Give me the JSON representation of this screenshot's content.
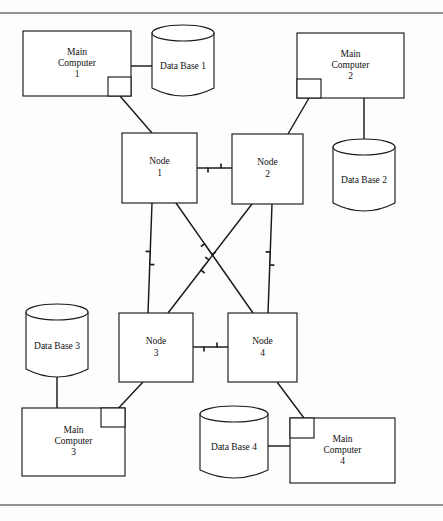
{
  "figure": {
    "rules": {
      "top_y": 13,
      "bottom_y": 505
    }
  },
  "main_computers": [
    {
      "id": "main-computer-1",
      "line1": "Main",
      "line2": "Computer",
      "line3": "1",
      "x": 23,
      "y": 31,
      "w": 108,
      "h": 65,
      "notch": {
        "corner": "bottom-right",
        "x": 108,
        "y": 77,
        "w": 23,
        "h": 19
      }
    },
    {
      "id": "main-computer-2",
      "line1": "Main",
      "line2": "Computer",
      "line3": "2",
      "x": 297,
      "y": 33,
      "w": 107,
      "h": 65,
      "notch": {
        "corner": "bottom-left",
        "x": 297,
        "y": 79,
        "w": 24,
        "h": 19
      }
    },
    {
      "id": "main-computer-3",
      "line1": "Main",
      "line2": "Computer",
      "line3": "3",
      "x": 22,
      "y": 408,
      "w": 103,
      "h": 68,
      "notch": {
        "corner": "top-right",
        "x": 101,
        "y": 408,
        "w": 24,
        "h": 19
      }
    },
    {
      "id": "main-computer-4",
      "line1": "Main",
      "line2": "Computer",
      "line3": "4",
      "x": 290,
      "y": 418,
      "w": 105,
      "h": 65,
      "notch": {
        "corner": "top-left",
        "x": 290,
        "y": 418,
        "w": 24,
        "h": 20
      }
    }
  ],
  "databases": [
    {
      "id": "data-base-1",
      "label": "Data Base 1",
      "cx": 183,
      "top": 33,
      "bottom": 96,
      "rx": 31,
      "ry": 8
    },
    {
      "id": "data-base-2",
      "label": "Data Base 2",
      "cx": 364,
      "top": 147,
      "bottom": 211,
      "rx": 31,
      "ry": 8
    },
    {
      "id": "data-base-3",
      "label": "Data Base 3",
      "cx": 57,
      "top": 312,
      "bottom": 377,
      "rx": 31,
      "ry": 8
    },
    {
      "id": "data-base-4",
      "label": "Data Base 4",
      "cx": 234,
      "top": 414,
      "bottom": 478,
      "rx": 34,
      "ry": 8
    }
  ],
  "nodes": [
    {
      "id": "node-1",
      "line1": "Node",
      "line2": "1",
      "x": 122,
      "y": 133,
      "w": 75,
      "h": 70
    },
    {
      "id": "node-2",
      "line1": "Node",
      "line2": "2",
      "x": 232,
      "y": 134,
      "w": 71,
      "h": 70
    },
    {
      "id": "node-3",
      "line1": "Node",
      "line2": "3",
      "x": 119,
      "y": 313,
      "w": 74,
      "h": 69
    },
    {
      "id": "node-4",
      "line1": "Node",
      "line2": "4",
      "x": 228,
      "y": 313,
      "w": 69,
      "h": 69
    }
  ],
  "plain_links": [
    {
      "id": "link-mc1-db1",
      "from": "main-computer-1",
      "to": "data-base-1",
      "x1": 131,
      "y1": 66,
      "x2": 152,
      "y2": 66
    },
    {
      "id": "link-mc1-node1",
      "from": "main-computer-1",
      "to": "node-1",
      "x1": 120,
      "y1": 96,
      "x2": 152,
      "y2": 133
    },
    {
      "id": "link-mc2-node2",
      "from": "main-computer-2",
      "to": "node-2",
      "x1": 309,
      "y1": 98,
      "x2": 288,
      "y2": 134
    },
    {
      "id": "link-mc2-db2",
      "from": "main-computer-2",
      "to": "data-base-2",
      "x1": 364,
      "y1": 98,
      "x2": 364,
      "y2": 147
    },
    {
      "id": "link-db3-mc3",
      "from": "data-base-3",
      "to": "main-computer-3",
      "x1": 57,
      "y1": 377,
      "x2": 57,
      "y2": 408
    },
    {
      "id": "link-node3-mc3",
      "from": "node-3",
      "to": "main-computer-3",
      "x1": 143,
      "y1": 382,
      "x2": 113,
      "y2": 414
    },
    {
      "id": "link-node4-mc4",
      "from": "node-4",
      "to": "main-computer-4",
      "x1": 277,
      "y1": 382,
      "x2": 304,
      "y2": 418
    },
    {
      "id": "link-db4-mc4",
      "from": "data-base-4",
      "to": "main-computer-4",
      "x1": 268,
      "y1": 446,
      "x2": 290,
      "y2": 446
    }
  ],
  "network_links": [
    {
      "id": "link-node1-node2",
      "from": "node-1",
      "to": "node-2",
      "x1": 197,
      "y1": 168,
      "x2": 232,
      "y2": 168,
      "bolt_t": 0.5
    },
    {
      "id": "link-node3-node4",
      "from": "node-3",
      "to": "node-4",
      "x1": 193,
      "y1": 347,
      "x2": 228,
      "y2": 347,
      "bolt_t": 0.5
    },
    {
      "id": "link-node1-node3",
      "from": "node-1",
      "to": "node-3",
      "x1": 152,
      "y1": 203,
      "x2": 148,
      "y2": 313,
      "bolt_t": 0.5
    },
    {
      "id": "link-node2-node4",
      "from": "node-2",
      "to": "node-4",
      "x1": 272,
      "y1": 204,
      "x2": 268,
      "y2": 313,
      "bolt_t": 0.5
    },
    {
      "id": "link-node1-node4",
      "from": "node-1",
      "to": "node-4",
      "x1": 176,
      "y1": 203,
      "x2": 253,
      "y2": 313,
      "bolt_t": 0.42
    },
    {
      "id": "link-node2-node3",
      "from": "node-2",
      "to": "node-3",
      "x1": 252,
      "y1": 204,
      "x2": 168,
      "y2": 313,
      "bolt_t": 0.56
    }
  ]
}
